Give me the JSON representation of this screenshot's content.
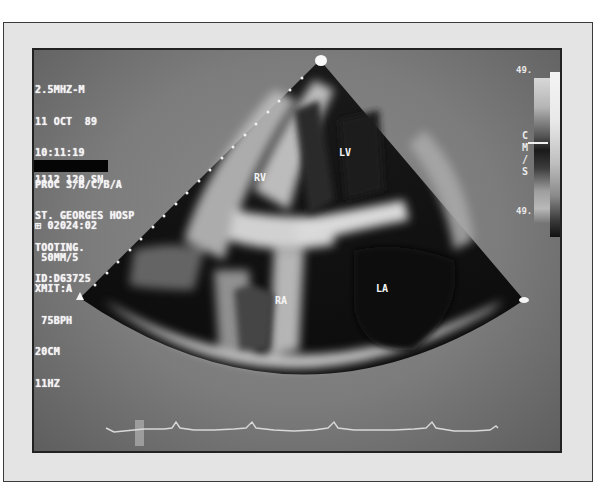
{
  "image": {
    "description": "Echocardiogram, apical four-chamber view, photographed from ultrasound monitor",
    "colors": {
      "frame": "#e4e4e4",
      "screen_background": "#7c7c7c",
      "sector_dark": "#0e0e0e",
      "tissue_bright": "#f0f0f0",
      "overlay_text": "#f2f2f2"
    }
  },
  "overlay": {
    "top_block": [
      "2.5MHZ-M",
      "11 OCT  89",
      "10:11:19",
      "PROC 3/B/C/B/A",
      "ST. GEORGES HOSP",
      "TOOTING.",
      "ID:D63725"
    ],
    "sn_line": "1112 120 SN",
    "bottom_block": [
      "⊞ 02024:02",
      " 50MM/5",
      "XMIT:A",
      " 75BPH",
      "20CM",
      "11HZ"
    ]
  },
  "chambers": {
    "rv": "RV",
    "lv": "LV",
    "ra": "RA",
    "la": "LA"
  },
  "scale": {
    "top_value": "49.",
    "bottom_value": "49.",
    "unit": [
      "C",
      "M",
      "/",
      "S"
    ]
  },
  "ecg": {
    "label": "ECG trace",
    "peaks_count": 5
  }
}
